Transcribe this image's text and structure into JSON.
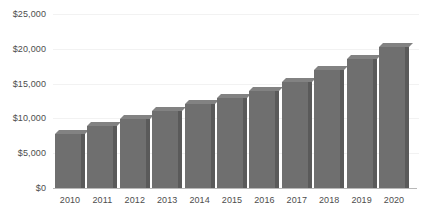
{
  "chart_data": {
    "type": "bar",
    "title": "",
    "subtitle": "",
    "xlabel": "",
    "ylabel": "",
    "categories": [
      "2010",
      "2011",
      "2012",
      "2013",
      "2014",
      "2015",
      "2016",
      "2017",
      "2018",
      "2019",
      "2020"
    ],
    "values": [
      7700,
      8900,
      9900,
      11000,
      12000,
      12900,
      13900,
      15200,
      16900,
      18600,
      20300
    ],
    "series": [
      {
        "name": "",
        "values": [
          7700,
          8900,
          9900,
          11000,
          12000,
          12900,
          13900,
          15200,
          16900,
          18600,
          20300
        ]
      }
    ],
    "ylim": [
      0,
      25000
    ],
    "y_ticks": [
      0,
      5000,
      10000,
      15000,
      20000,
      25000
    ],
    "y_tick_labels": [
      "$0",
      "$5,000",
      "$10,000",
      "$15,000",
      "$20,000",
      "$25,000"
    ],
    "x_tick_labels": [
      "2010",
      "2011",
      "2012",
      "2013",
      "2014",
      "2015",
      "2016",
      "2017",
      "2018",
      "2019",
      "2020"
    ],
    "grid": true,
    "legend": false,
    "legend_position": "none",
    "annotations": [],
    "colors": {
      "bar_front": "#6f6f6f",
      "bar_side": "#5a5a5a",
      "bar_top": "#828282",
      "gridline": "#f2f2f2",
      "axis_line": "#b8b8b8",
      "tick_text": "#4d4d4d",
      "background": "#ffffff"
    }
  }
}
